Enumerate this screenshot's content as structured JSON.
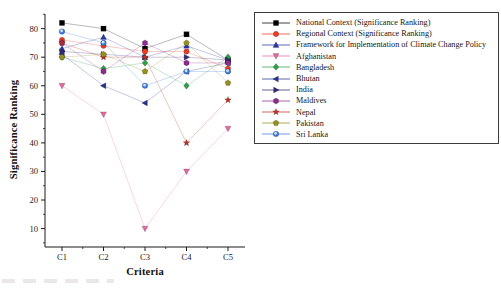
{
  "figure": {
    "background": "#ffffff",
    "axis_color": "#1a1a1a",
    "legend_border_color": "#3c3c3c"
  },
  "chart_data": {
    "type": "line",
    "title": "",
    "xlabel": "Criteria",
    "ylabel": "Significance Ranking",
    "categories": [
      "C1",
      "C2",
      "C3",
      "C4",
      "C5"
    ],
    "yticks": [
      10,
      20,
      30,
      40,
      50,
      60,
      70,
      80
    ],
    "ylim": [
      3,
      85
    ],
    "grid": false,
    "legend_position": "outside-top-right",
    "series": [
      {
        "name": "National Context (Significance Ranking)",
        "color": "#000000",
        "marker": "square",
        "values": [
          82,
          80,
          73,
          78,
          69
        ]
      },
      {
        "name": "Regional Context (Significance Ranking)",
        "color": "#ee3b24",
        "marker": "circle",
        "values": [
          76,
          74,
          72,
          72,
          66
        ]
      },
      {
        "name": "Framework for Implementation of Climate Change Policy",
        "color": "#2636a8",
        "marker": "triangle-up",
        "values": [
          73,
          77,
          70,
          74,
          69
        ]
      },
      {
        "name": "Afghanistan",
        "color": "#e469a1",
        "marker": "triangle-down",
        "values": [
          60,
          50,
          10,
          30,
          45
        ]
      },
      {
        "name": "Bangladesh",
        "color": "#2e9e49",
        "marker": "diamond",
        "values": [
          70,
          66,
          68,
          60,
          70
        ]
      },
      {
        "name": "Bhutan",
        "color": "#28338f",
        "marker": "triangle-left",
        "values": [
          71,
          60,
          54,
          65,
          68
        ]
      },
      {
        "name": "India",
        "color": "#352a71",
        "marker": "triangle-right",
        "values": [
          72,
          71,
          70,
          70,
          69
        ]
      },
      {
        "name": "Maldives",
        "color": "#8c2d8f",
        "marker": "hexagon",
        "values": [
          75,
          65,
          75,
          68,
          68
        ]
      },
      {
        "name": "Nepal",
        "color": "#c03028",
        "marker": "star",
        "values": [
          75,
          70,
          70,
          40,
          55
        ]
      },
      {
        "name": "Pakistan",
        "color": "#96911f",
        "marker": "pentagon",
        "values": [
          70,
          71,
          65,
          75,
          61
        ]
      },
      {
        "name": "Sri Lanka",
        "color": "#3f7bd6",
        "marker": "sphere",
        "values": [
          79,
          75,
          60,
          65,
          65
        ]
      }
    ]
  }
}
